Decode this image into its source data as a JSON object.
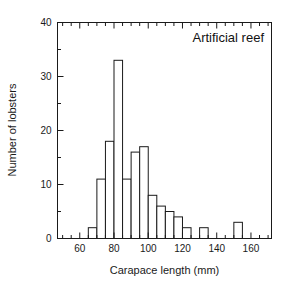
{
  "chart_data": {
    "type": "bar",
    "title": "Artificial reef",
    "xlabel": "Carapace length (mm)",
    "ylabel": "Number of lobsters",
    "xlim": [
      47,
      172
    ],
    "ylim": [
      0,
      40
    ],
    "grid": false,
    "legend": null,
    "bin_width": 5,
    "x_major_ticks": [
      60,
      80,
      100,
      120,
      140,
      160
    ],
    "x_major_tick_labels": [
      "60",
      "80",
      "100",
      "120",
      "140",
      "160"
    ],
    "x_minor_tick_step": 5,
    "y_major_ticks": [
      0,
      10,
      20,
      30,
      40
    ],
    "y_major_tick_labels": [
      "0",
      "10",
      "20",
      "30",
      "40"
    ],
    "y_minor_tick_step": 5,
    "bin_edges": [
      65,
      70,
      75,
      80,
      85,
      90,
      95,
      100,
      105,
      110,
      115,
      120,
      125,
      130,
      135,
      140,
      145,
      150,
      155
    ],
    "categories": [
      "65-70",
      "70-75",
      "75-80",
      "80-85",
      "85-90",
      "90-95",
      "95-100",
      "100-105",
      "105-110",
      "110-115",
      "115-120",
      "120-125",
      "125-130",
      "130-135",
      "135-140",
      "140-145",
      "145-150",
      "150-155"
    ],
    "values": [
      2,
      11,
      18,
      33,
      11,
      16,
      17,
      8,
      6,
      5,
      4,
      2,
      0,
      2,
      0,
      0,
      0,
      3
    ],
    "bar_fill_color": "#ffffff",
    "bar_edge_color": "#1a1a1a",
    "axis_color": "#1a1a1a"
  }
}
